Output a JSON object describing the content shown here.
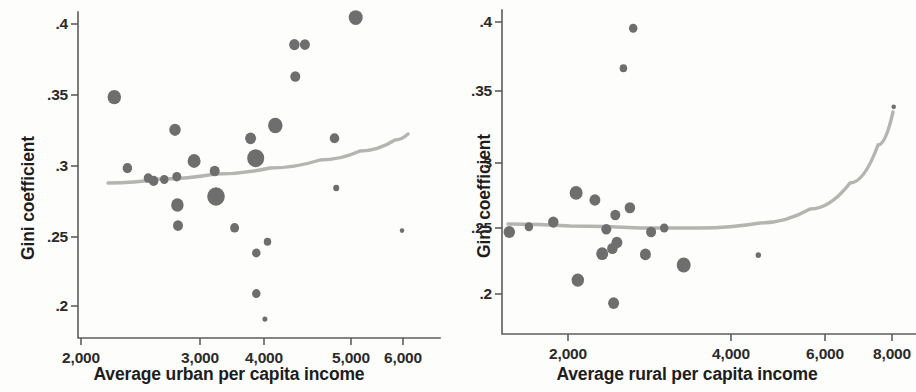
{
  "figure": {
    "panel_count": 2,
    "marker_color": "#6e6e6e",
    "fit_line_color": "#b4b4b0",
    "axis_color": "#5d5d5d"
  },
  "chart_data": [
    {
      "type": "scatter",
      "panel": "left",
      "title": "",
      "xlabel": "Average urban per capita income",
      "ylabel": "Gini coefficient",
      "xtick_labels": [
        "2,000",
        "3,000",
        "4,000",
        "5,000",
        "6,000"
      ],
      "xtick_values": [
        2000,
        3000,
        4000,
        5000,
        6000
      ],
      "xtick_px": [
        81,
        200,
        264,
        351,
        403
      ],
      "ytick_labels": [
        ".4",
        ".35",
        ".3",
        ".25",
        ".2"
      ],
      "ytick_values": [
        0.4,
        0.35,
        0.3,
        0.25,
        0.2
      ],
      "ytick_px": [
        24,
        95,
        166,
        237,
        306
      ],
      "xlim": [
        1900,
        6150
      ],
      "ylim": [
        0.185,
        0.408
      ],
      "grid": false,
      "legend": "none",
      "marker_encoding": "bubble size = population weight",
      "points": [
        {
          "x": 2280,
          "y": 0.3485,
          "size": 13.5
        },
        {
          "x": 2390,
          "y": 0.2985,
          "size": 9.5
        },
        {
          "x": 2565,
          "y": 0.2915,
          "size": 9.0
        },
        {
          "x": 2610,
          "y": 0.2895,
          "size": 9.5
        },
        {
          "x": 2700,
          "y": 0.2905,
          "size": 8.5
        },
        {
          "x": 2790,
          "y": 0.3255,
          "size": 11.5
        },
        {
          "x": 2805,
          "y": 0.2925,
          "size": 9.0
        },
        {
          "x": 2810,
          "y": 0.2725,
          "size": 12.5
        },
        {
          "x": 2815,
          "y": 0.258,
          "size": 10.0
        },
        {
          "x": 2950,
          "y": 0.3035,
          "size": 13.0
        },
        {
          "x": 3230,
          "y": 0.2965,
          "size": 10.0
        },
        {
          "x": 3250,
          "y": 0.2785,
          "size": 17.5
        },
        {
          "x": 3540,
          "y": 0.2565,
          "size": 9.0
        },
        {
          "x": 3790,
          "y": 0.3195,
          "size": 11.0
        },
        {
          "x": 3870,
          "y": 0.3055,
          "size": 17.0
        },
        {
          "x": 3880,
          "y": 0.2385,
          "size": 8.5
        },
        {
          "x": 3880,
          "y": 0.209,
          "size": 8.5
        },
        {
          "x": 4010,
          "y": 0.1905,
          "size": 5.0
        },
        {
          "x": 4040,
          "y": 0.2465,
          "size": 7.5
        },
        {
          "x": 4130,
          "y": 0.3285,
          "size": 14.5
        },
        {
          "x": 4350,
          "y": 0.3855,
          "size": 10.5
        },
        {
          "x": 4360,
          "y": 0.363,
          "size": 10.0
        },
        {
          "x": 4470,
          "y": 0.3855,
          "size": 10.0
        },
        {
          "x": 4810,
          "y": 0.3195,
          "size": 9.5
        },
        {
          "x": 4830,
          "y": 0.2845,
          "size": 6.0
        },
        {
          "x": 5090,
          "y": 0.4045,
          "size": 14.0
        },
        {
          "x": 5980,
          "y": 0.2545,
          "size": 4.5
        }
      ],
      "fit_line": {
        "label": "fitted quadratic",
        "points_px": [
          [
            108,
            183
          ],
          [
            160,
            179
          ],
          [
            215,
            174
          ],
          [
            270,
            168
          ],
          [
            320,
            160
          ],
          [
            360,
            151
          ],
          [
            395,
            140
          ],
          [
            408,
            134
          ]
        ]
      }
    },
    {
      "type": "scatter",
      "panel": "right",
      "title": "",
      "xlabel": "Average rural per capita income",
      "ylabel": "Gini coefficient",
      "xtick_labels": [
        "2,000",
        "4,000",
        "6,000",
        "8,000"
      ],
      "xtick_values": [
        2000,
        4000,
        6000,
        8000
      ],
      "xtick_px": [
        568,
        731,
        825,
        892
      ],
      "ytick_labels": [
        ".4",
        ".35",
        ".3",
        ".25",
        ".2"
      ],
      "ytick_values": [
        0.4,
        0.35,
        0.3,
        0.25,
        0.2
      ],
      "ytick_px": [
        22,
        91,
        163,
        228,
        294
      ],
      "xlim": [
        1200,
        8400
      ],
      "ylim": [
        0.185,
        0.408
      ],
      "grid": false,
      "legend": "none",
      "marker_encoding": "bubble size = population weight",
      "points": [
        {
          "x": 1280,
          "y": 0.247,
          "size": 11.5
        },
        {
          "x": 1520,
          "y": 0.251,
          "size": 8.5
        },
        {
          "x": 1820,
          "y": 0.2545,
          "size": 10.5
        },
        {
          "x": 2100,
          "y": 0.277,
          "size": 13.0
        },
        {
          "x": 2120,
          "y": 0.2105,
          "size": 12.5
        },
        {
          "x": 2330,
          "y": 0.2715,
          "size": 11.0
        },
        {
          "x": 2420,
          "y": 0.2305,
          "size": 12.0
        },
        {
          "x": 2470,
          "y": 0.249,
          "size": 10.0
        },
        {
          "x": 2545,
          "y": 0.2345,
          "size": 10.5
        },
        {
          "x": 2560,
          "y": 0.193,
          "size": 11.0
        },
        {
          "x": 2580,
          "y": 0.26,
          "size": 10.0
        },
        {
          "x": 2600,
          "y": 0.239,
          "size": 11.0
        },
        {
          "x": 2680,
          "y": 0.3665,
          "size": 7.5
        },
        {
          "x": 2760,
          "y": 0.2655,
          "size": 10.5
        },
        {
          "x": 2800,
          "y": 0.3955,
          "size": 8.5
        },
        {
          "x": 2950,
          "y": 0.23,
          "size": 11.0
        },
        {
          "x": 3020,
          "y": 0.247,
          "size": 10.0
        },
        {
          "x": 3180,
          "y": 0.25,
          "size": 8.5
        },
        {
          "x": 3420,
          "y": 0.222,
          "size": 14.0
        },
        {
          "x": 4580,
          "y": 0.2295,
          "size": 5.5
        },
        {
          "x": 8050,
          "y": 0.339,
          "size": 4.5
        }
      ],
      "fit_line": {
        "label": "fitted quadratic",
        "points_px": [
          [
            508,
            224
          ],
          [
            570,
            226
          ],
          [
            640,
            228
          ],
          [
            700,
            228
          ],
          [
            760,
            223
          ],
          [
            810,
            209
          ],
          [
            850,
            183
          ],
          [
            878,
            145
          ],
          [
            893,
            112
          ]
        ]
      }
    }
  ]
}
